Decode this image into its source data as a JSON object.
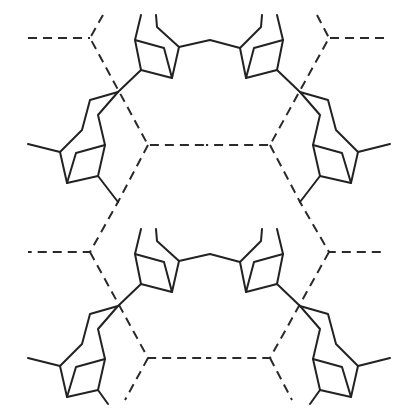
{
  "diagram": {
    "type": "crystal-packing / hydrogen-bonded network",
    "colors": {
      "bond": "#222222",
      "hydrogen_bond": "#2a2a2a",
      "background": "#ffffff"
    },
    "legend": [],
    "labels": []
  }
}
